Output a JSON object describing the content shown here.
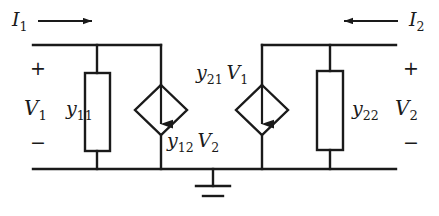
{
  "figure": {
    "stroke_color": "#1a1a1a",
    "background_color": "#ffffff"
  },
  "labels": {
    "current_left": {
      "var": "I",
      "sub": "1"
    },
    "current_right": {
      "var": "I",
      "sub": "2"
    },
    "voltage_left": {
      "var": "V",
      "sub": "1"
    },
    "voltage_right": {
      "var": "V",
      "sub": "2"
    },
    "admittance_left": {
      "var": "y",
      "sub": "11"
    },
    "admittance_right": {
      "var": "y",
      "sub": "22"
    },
    "source_left": {
      "var1": "y",
      "sub1": "12",
      "var2": "V",
      "sub2": "2"
    },
    "source_right": {
      "var1": "y",
      "sub1": "21",
      "var2": "V",
      "sub2": "1"
    }
  },
  "polarity": {
    "plus": "+",
    "minus": "−"
  },
  "elements": {
    "resistor_left_name": "y11-admittance-box",
    "resistor_right_name": "y22-admittance-box",
    "source_left_name": "dependent-current-source-y12v2",
    "source_right_name": "dependent-current-source-y21v1",
    "ground_name": "ground-symbol"
  }
}
